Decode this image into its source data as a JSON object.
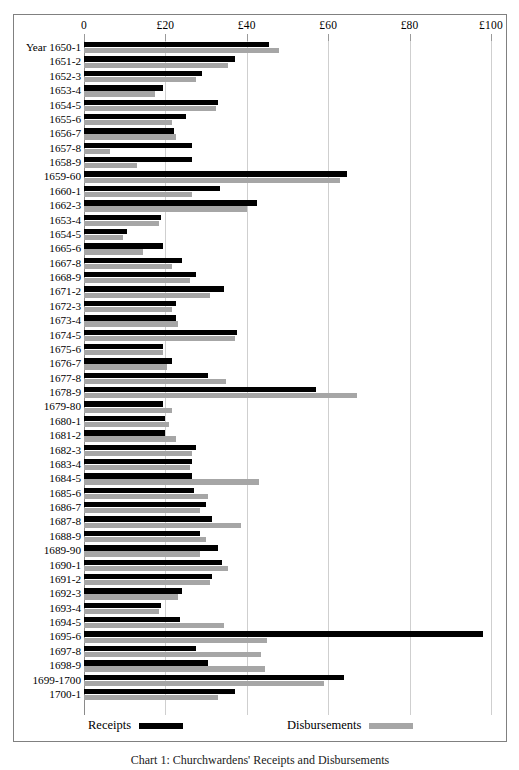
{
  "figure": {
    "caption": "Chart 1: Churchwardens' Receipts and Disbursements"
  },
  "legend": {
    "position": "bottom",
    "entries": [
      {
        "label": "Receipts",
        "color": "#000000",
        "key": "receipts"
      },
      {
        "label": "Disbursements",
        "color": "#a6a6a6",
        "key": "disbursements"
      }
    ]
  },
  "axis": {
    "row_axis_title": "Year",
    "tick_labels": [
      "0",
      "£20",
      "£40",
      "£60",
      "£80",
      "£100"
    ],
    "tick_values": [
      0,
      20,
      40,
      60,
      80,
      100
    ]
  },
  "chart_data": {
    "type": "bar",
    "orientation": "horizontal",
    "title": "",
    "subtitle": "",
    "xlabel": "",
    "ylabel": "Year",
    "xlim": [
      0,
      100
    ],
    "grid": true,
    "currency": "£",
    "legend_position": "bottom",
    "categories": [
      "Year 1650-1",
      "1651-2",
      "1652-3",
      "1653-4",
      "1654-5",
      "1655-6",
      "1656-7",
      "1657-8",
      "1658-9",
      "1659-60",
      "1660-1",
      "1662-3",
      "1653-4",
      "1654-5",
      "1665-6",
      "1667-8",
      "1668-9",
      "1671-2",
      "1672-3",
      "1673-4",
      "1674-5",
      "1675-6",
      "1676-7",
      "1677-8",
      "1678-9",
      "1679-80",
      "1680-1",
      "1681-2",
      "1682-3",
      "1683-4",
      "1684-5",
      "1685-6",
      "1686-7",
      "1687-8",
      "1688-9",
      "1689-90",
      "1690-1",
      "1691-2",
      "1692-3",
      "1693-4",
      "1694-5",
      "1695-6",
      "1697-8",
      "1698-9",
      "1699-1700",
      "1700-1"
    ],
    "series": [
      {
        "name": "Receipts",
        "color": "#000000",
        "values": [
          45.5,
          37.0,
          29.0,
          19.5,
          33.0,
          25.0,
          22.0,
          26.5,
          26.5,
          64.5,
          33.5,
          42.5,
          19.0,
          10.5,
          19.5,
          24.0,
          27.5,
          34.5,
          22.5,
          22.5,
          37.5,
          19.5,
          21.5,
          30.5,
          57.0,
          19.5,
          20.0,
          20.0,
          27.5,
          26.5,
          26.5,
          27.0,
          30.0,
          31.5,
          28.5,
          33.0,
          34.0,
          31.5,
          24.0,
          19.0,
          23.5,
          98.0,
          27.5,
          30.5,
          64.0,
          37.0
        ]
      },
      {
        "name": "Disbursements",
        "color": "#a6a6a6",
        "values": [
          48.0,
          35.5,
          27.5,
          17.5,
          32.5,
          21.5,
          22.5,
          6.5,
          13.0,
          63.0,
          26.5,
          40.0,
          18.5,
          9.5,
          14.5,
          21.5,
          26.0,
          31.0,
          21.5,
          23.0,
          37.0,
          19.5,
          20.5,
          35.0,
          67.0,
          21.5,
          21.0,
          22.5,
          26.5,
          26.0,
          43.0,
          30.5,
          28.5,
          38.5,
          30.0,
          28.5,
          35.5,
          31.0,
          23.0,
          18.5,
          34.5,
          45.0,
          43.5,
          44.5,
          59.0,
          33.0
        ]
      }
    ]
  }
}
